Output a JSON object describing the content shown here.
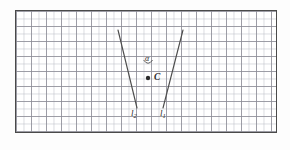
{
  "figure": {
    "kind": "geometry-diagram",
    "background_color": "#ffffff",
    "ink_color": "#2b2b2b",
    "grid": {
      "border_color": "#4a4a4a",
      "major_line_color": "#8c8c96",
      "minor_line_color": "#b9bcc4",
      "major_cell_px": 15,
      "minor_cell_px": 7.5,
      "columns": 17,
      "rows": 8
    },
    "labels": {
      "point_c": "C",
      "angle": "α",
      "line_1_name": "l",
      "line_1_sub": "1",
      "line_2_name": "l",
      "line_2_sub": "2"
    },
    "geometry": {
      "intersection_point": {
        "x": 148,
        "y": 78
      },
      "line_1": {
        "x1": 183,
        "y1": 30,
        "x2": 163,
        "y2": 108
      },
      "line_2": {
        "x1": 118,
        "y1": 30,
        "x2": 137,
        "y2": 108
      },
      "angle_arc": {
        "cx": 148,
        "cy": 78,
        "radius": 18
      },
      "point_marker_radius": 2.2
    }
  }
}
